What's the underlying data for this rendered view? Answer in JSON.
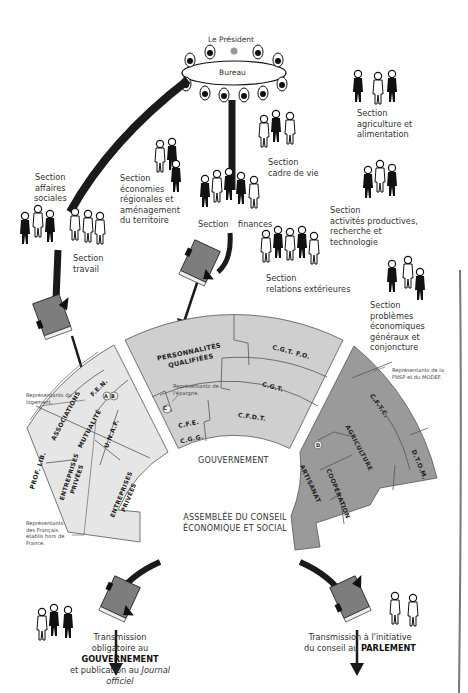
{
  "top": {
    "president_label": "Le Président",
    "bureau_label": "Bureau"
  },
  "sections": [
    {
      "id": "affaires-sociales",
      "lines": [
        "Section",
        "affaires",
        "sociales"
      ]
    },
    {
      "id": "travail",
      "lines": [
        "Section",
        "travail"
      ]
    },
    {
      "id": "economies-regionales",
      "lines": [
        "Section",
        "économies",
        "régionales et",
        "aménagement",
        "du territoire"
      ]
    },
    {
      "id": "cadre-de-vie",
      "lines": [
        "Section",
        "cadre de vie"
      ]
    },
    {
      "id": "finances",
      "left": "Section",
      "right": "finances"
    },
    {
      "id": "relations-exterieures",
      "lines": [
        "Section",
        "relations extérieures"
      ]
    },
    {
      "id": "agriculture",
      "lines": [
        "Section",
        "agriculture et",
        "alimentation"
      ]
    },
    {
      "id": "activites-productives",
      "lines": [
        "Section",
        "activités productives,",
        "recherche et",
        "technologie"
      ]
    },
    {
      "id": "problemes-economiques",
      "lines": [
        "Section",
        "problèmes",
        "économiques",
        "généraux et",
        "conjoncture"
      ]
    }
  ],
  "books": {
    "projet_label": "PROJET D'AVIS",
    "avis_label": "AVIS"
  },
  "fan_left": {
    "segments": [
      "F.E.N.",
      "ASSOCIATIONS",
      "MUTUALITÉ",
      "A",
      "B",
      "PROF. LIB.",
      "ENTREPRISES PRIVÉES",
      "U.N.A.F.",
      "ENTREPRISES PRIVÉES"
    ],
    "note_logement": "Représentants du logement.",
    "note_francais": "Représentants des Français établis hors de France."
  },
  "fan_center": {
    "segments": [
      "PERSONNALITÉS QUALIFIÉES",
      "C.G.T. F.O.",
      "C.G.T.",
      "C",
      "C.F.E.",
      "C.G.G.",
      "C.F.D.T."
    ],
    "note_epargne": "Représentants de l'épargne.",
    "label": "GOUVERNEMENT"
  },
  "fan_right": {
    "segments": [
      "C.F.T.C.",
      "AGRICULTURE",
      "D.T.O.M.",
      "D",
      "ARTISANAT",
      "COOPÉRATION"
    ],
    "note_fnsp": "Représentants de la FNSP et du MODEF."
  },
  "assembly": {
    "line1": "ASSEMBLÉE DU CONSEIL",
    "line2": "ÉCONOMIQUE ET SOCIAL"
  },
  "outputs": {
    "left": {
      "line1": "Transmission",
      "line2_prefix": "obligatoire au ",
      "line2_bold": "GOUVERNEMENT",
      "line3_prefix": "et publication au ",
      "line3_italic": "Journal officiel"
    },
    "right": {
      "line1": "Transmission à l'initiative",
      "line2_prefix": "du conseil au ",
      "line2_bold": "PARLEMENT"
    }
  },
  "colors": {
    "left_fan": "#e6e6e6",
    "center_fan": "#cfcfcf",
    "right_fan": "#9a9a9a",
    "stroke": "#555555",
    "book": "#7d7d7d",
    "path": "#1a1a1a"
  }
}
